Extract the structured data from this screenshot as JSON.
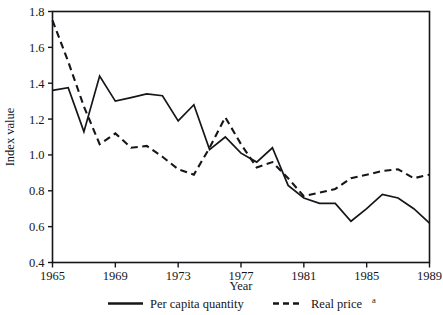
{
  "chart_data": {
    "type": "line",
    "title": "",
    "xlabel": "Year",
    "ylabel": "Index value",
    "xlim": [
      1965,
      1989
    ],
    "ylim": [
      0.4,
      1.8
    ],
    "grid": false,
    "legend_position": "bottom",
    "x": [
      1965,
      1966,
      1967,
      1968,
      1969,
      1970,
      1971,
      1972,
      1973,
      1974,
      1975,
      1976,
      1977,
      1978,
      1979,
      1980,
      1981,
      1982,
      1983,
      1984,
      1985,
      1986,
      1987,
      1988,
      1989
    ],
    "xticks": [
      1965,
      1969,
      1973,
      1977,
      1981,
      1985,
      1989
    ],
    "xticklabels": [
      "1965",
      "1969",
      "1973",
      "1977",
      "1981",
      "1985",
      "1989"
    ],
    "yticks": [
      0.4,
      0.6,
      0.8,
      1.0,
      1.2,
      1.4,
      1.6,
      1.8
    ],
    "yticklabels": [
      "0.4",
      "0.6",
      "0.8",
      "1.0",
      "1.2",
      "1.4",
      "1.6",
      "1.8"
    ],
    "series": [
      {
        "name": "Per capita quantity",
        "style": "solid",
        "color": "#16161a",
        "values": [
          1.36,
          1.375,
          1.13,
          1.44,
          1.3,
          1.32,
          1.34,
          1.33,
          1.19,
          1.28,
          1.03,
          1.1,
          1.01,
          0.96,
          1.04,
          0.83,
          0.76,
          0.73,
          0.73,
          0.63,
          0.7,
          0.78,
          0.76,
          0.7,
          0.62
        ]
      },
      {
        "name": "Real price",
        "style": "dashed",
        "color": "#16161a",
        "superscript": "a",
        "values": [
          1.75,
          1.52,
          1.27,
          1.06,
          1.12,
          1.04,
          1.05,
          0.99,
          0.92,
          0.89,
          1.04,
          1.21,
          1.06,
          0.93,
          0.96,
          0.87,
          0.77,
          0.79,
          0.81,
          0.87,
          0.89,
          0.91,
          0.92,
          0.87,
          0.89
        ]
      }
    ]
  },
  "axes": {
    "y_title": "Index value",
    "x_title": "Year"
  },
  "legend": {
    "items": [
      {
        "label": "Per capita quantity",
        "style": "solid",
        "superscript": ""
      },
      {
        "label": "Real price",
        "style": "dashed",
        "superscript": "a"
      }
    ]
  }
}
